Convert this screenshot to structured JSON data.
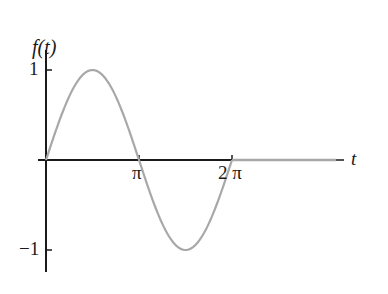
{
  "chart_data": {
    "type": "line",
    "title": "",
    "xlabel": "t",
    "ylabel": "f(t)",
    "function": "f(t) = sin(t) for 0 <= t <= 2π, f(t) = 0 for t > 2π",
    "x_ticks": [
      {
        "value": 3.14159,
        "label": "π"
      },
      {
        "value": 6.28319,
        "label": "2 π"
      }
    ],
    "y_ticks": [
      {
        "value": 1,
        "label": "1"
      },
      {
        "value": -1,
        "label": "−1"
      }
    ],
    "xlim": [
      0,
      9.5
    ],
    "ylim": [
      -1.25,
      1.25
    ],
    "grid": false,
    "legend": null,
    "series": [
      {
        "name": "f(t)",
        "color": "#a8a8a8",
        "x": [
          0,
          0.785,
          1.571,
          2.356,
          3.142,
          3.927,
          4.712,
          5.498,
          6.283,
          7.0,
          8.0,
          9.5
        ],
        "values": [
          0,
          0.707,
          1,
          0.707,
          0,
          -0.707,
          -1,
          -0.707,
          0,
          0,
          0,
          0
        ]
      }
    ],
    "colors": {
      "axis": "#1a1a1a",
      "curve": "#a8a8a8"
    }
  },
  "labels": {
    "ylabel": "f(t)",
    "xlabel": "t",
    "y_tick_pos": "1",
    "y_tick_neg": "−1",
    "x_tick_pi": "π",
    "x_tick_2pi": "2 π"
  }
}
